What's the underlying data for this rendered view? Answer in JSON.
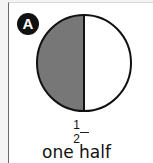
{
  "label": {
    "badge": "A"
  },
  "figure": {
    "shape": "circle",
    "parts": 2,
    "shaded_parts": 1,
    "shaded_side": "left",
    "shade_color": "#777777",
    "outline_color": "#111111"
  },
  "fraction": {
    "numerator": "1",
    "denominator": "2"
  },
  "caption": "one half"
}
